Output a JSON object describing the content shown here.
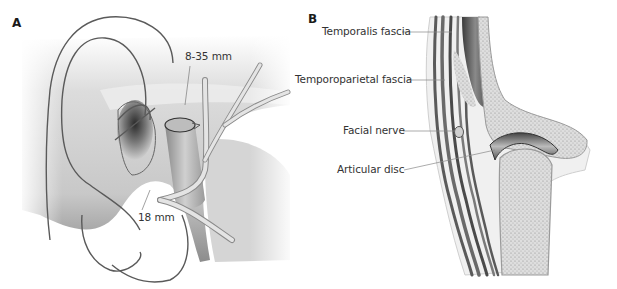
{
  "figure": {
    "panels": [
      {
        "id": "A",
        "letter": "A",
        "description": "Lateral view of ear region with facial nerve branches and incision lines",
        "labels": [
          {
            "text": "8-35 mm"
          },
          {
            "text": "18 mm"
          }
        ]
      },
      {
        "id": "B",
        "letter": "B",
        "description": "Coronal section through temporomandibular joint",
        "labels": [
          {
            "text": "Temporalis fascia"
          },
          {
            "text": "Temporoparietal fascia"
          },
          {
            "text": "Facial nerve"
          },
          {
            "text": "Articular disc"
          }
        ]
      }
    ]
  },
  "colors": {
    "background": "#ffffff",
    "skin_light": "#e6e6e6",
    "skin_shadow": "#9a9a9a",
    "incision_line": "#555555",
    "nerve": "#d4d4d4",
    "bone_fill": "#d9d9d9",
    "fascia_dark": "#5a5a5a",
    "label_text": "#333333"
  }
}
